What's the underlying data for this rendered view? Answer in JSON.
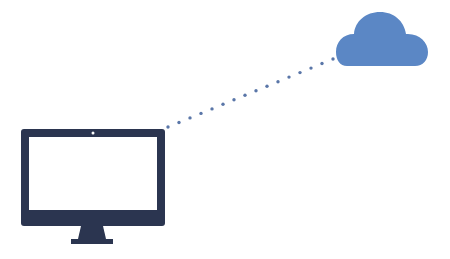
{
  "diagram": {
    "nodes": [
      {
        "id": "computer",
        "label": "desktop-monitor",
        "icon": "monitor-icon"
      },
      {
        "id": "cloud",
        "label": "cloud",
        "icon": "cloud-icon"
      }
    ],
    "edges": [
      {
        "from": "computer",
        "to": "cloud",
        "style": "dotted"
      }
    ]
  },
  "colors": {
    "monitor": "#2b3550",
    "screen": "#ffffff",
    "cloud": "#5b87c5",
    "connector": "#5a76a8",
    "background": "#ffffff"
  }
}
